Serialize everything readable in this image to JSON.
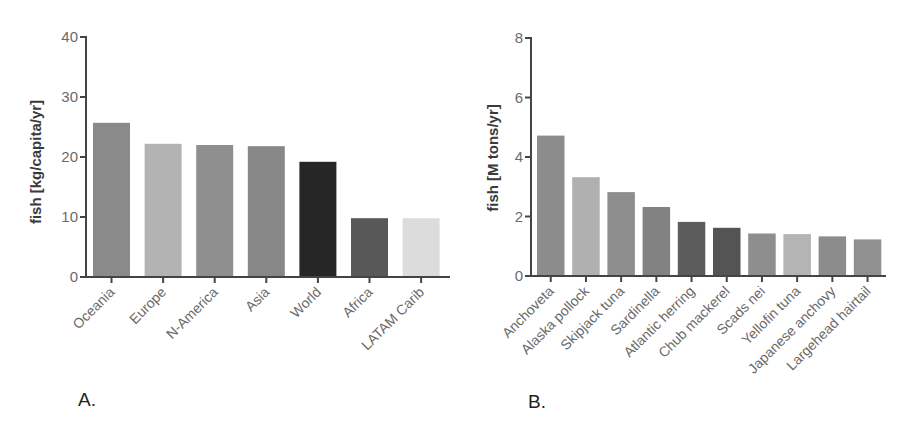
{
  "chart_data": [
    {
      "id": "A",
      "type": "bar",
      "panel_label": "A.",
      "title": "",
      "xlabel": "",
      "ylabel": "fish [kg/capita/yr]",
      "ylim": [
        0,
        40
      ],
      "yticks": [
        0,
        10,
        20,
        30,
        40
      ],
      "grid": false,
      "legend": "none",
      "categories": [
        "Oceania",
        "Europe",
        "N-America",
        "Asia",
        "World",
        "Africa",
        "LATAM Carib"
      ],
      "values": [
        25.7,
        22.2,
        22.0,
        21.8,
        19.2,
        9.8,
        9.8
      ],
      "colors": [
        "#8a8a8a",
        "#b3b3b3",
        "#8f8f8f",
        "#878787",
        "#262626",
        "#585858",
        "#dcdcdc"
      ]
    },
    {
      "id": "B",
      "type": "bar",
      "panel_label": "B.",
      "title": "",
      "xlabel": "",
      "ylabel": "fish [M tons/yr]",
      "ylim": [
        0,
        8
      ],
      "yticks": [
        0,
        2,
        4,
        6,
        8
      ],
      "grid": false,
      "legend": "none",
      "categories": [
        "Anchoveta",
        "Alaska pollock",
        "Skipjack tuna",
        "Sardinella",
        "Atlantic herring",
        "Chub mackerel",
        "Scads nei",
        "Yellofin tuna",
        "Japanese anchovy",
        "Largehead hairtail"
      ],
      "values": [
        4.72,
        3.32,
        2.82,
        2.32,
        1.82,
        1.62,
        1.43,
        1.41,
        1.33,
        1.23
      ],
      "colors": [
        "#8c8c8c",
        "#b0b0b0",
        "#8e8e8e",
        "#828282",
        "#5c5c5c",
        "#545454",
        "#8e8e8e",
        "#b4b4b4",
        "#8c8c8c",
        "#909090"
      ]
    }
  ],
  "style": {
    "axis_color": "#444444"
  }
}
